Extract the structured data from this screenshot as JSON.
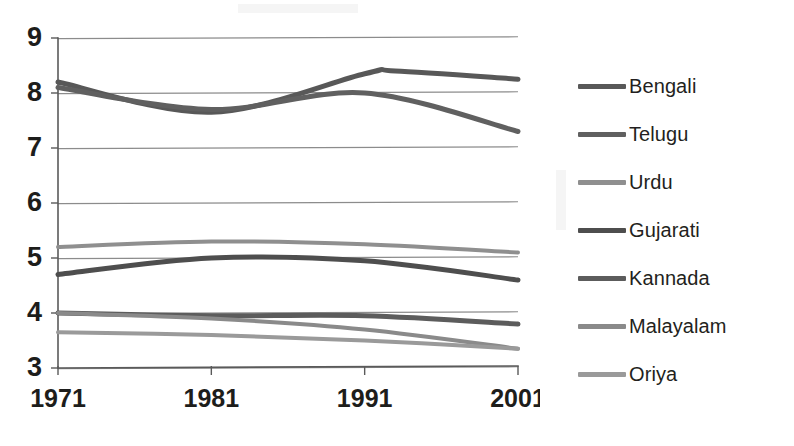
{
  "chart_data": {
    "type": "line",
    "title": "",
    "subtitle": "",
    "xlabel": "",
    "ylabel": "",
    "x": [
      1971,
      1981,
      1991,
      2001
    ],
    "categories": [
      "1971",
      "1981",
      "1991",
      "2001"
    ],
    "xlim": [
      1971,
      2001
    ],
    "ylim": [
      3,
      9
    ],
    "yticks": [
      3,
      4,
      5,
      6,
      7,
      8,
      9
    ],
    "ytick_labels": [
      "3",
      "4",
      "5",
      "6",
      "7",
      "8",
      "9"
    ],
    "xticks": [
      1971,
      1981,
      1991,
      2001
    ],
    "xtick_labels": [
      "1971",
      "1981",
      "1991",
      "2001"
    ],
    "grid": "horizontal",
    "legend_position": "right",
    "smoothing": "spline",
    "series": [
      {
        "name": "Bengali",
        "color": "#585858",
        "width": 5,
        "values": [
          8.2,
          7.65,
          8.35,
          8.25
        ],
        "peak_value": 8.4,
        "peak_x": 1993
      },
      {
        "name": "Telugu",
        "color": "#606060",
        "width": 5,
        "values": [
          8.1,
          7.7,
          8.0,
          7.3
        ]
      },
      {
        "name": "Urdu",
        "color": "#8f8f8f",
        "width": 4,
        "values": [
          5.2,
          5.3,
          5.25,
          5.1
        ]
      },
      {
        "name": "Gujarati",
        "color": "#4e4e4e",
        "width": 5,
        "values": [
          4.7,
          5.0,
          4.95,
          4.6
        ]
      },
      {
        "name": "Kannada",
        "color": "#5c5c5c",
        "width": 5,
        "values": [
          4.0,
          3.95,
          3.95,
          3.8
        ]
      },
      {
        "name": "Malayalam",
        "color": "#8a8a8a",
        "width": 4,
        "values": [
          4.0,
          3.9,
          3.7,
          3.35
        ]
      },
      {
        "name": "Oriya",
        "color": "#9a9a9a",
        "width": 4,
        "values": [
          3.65,
          3.6,
          3.5,
          3.35
        ]
      }
    ]
  },
  "legend": {
    "items": [
      {
        "label": "Bengali",
        "color": "#585858"
      },
      {
        "label": "Telugu",
        "color": "#606060"
      },
      {
        "label": "Urdu",
        "color": "#8f8f8f"
      },
      {
        "label": "Gujarati",
        "color": "#4e4e4e"
      },
      {
        "label": "Kannada",
        "color": "#5c5c5c"
      },
      {
        "label": "Malayalam",
        "color": "#8a8a8a"
      },
      {
        "label": "Oriya",
        "color": "#9a9a9a"
      }
    ]
  },
  "axes": {
    "y_labels": [
      "9",
      "8",
      "7",
      "6",
      "5",
      "4",
      "3"
    ],
    "x_labels": [
      "1971",
      "1981",
      "1991",
      "2001"
    ]
  },
  "colors": {
    "axis": "#5a5a5a",
    "grid": "#8c8c8c",
    "text": "#231f20",
    "background": "#ffffff"
  }
}
